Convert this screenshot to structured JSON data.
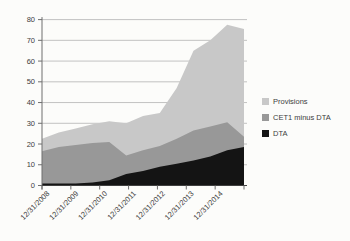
{
  "chart_data": {
    "type": "area",
    "stacked": true,
    "title": "",
    "xlabel": "",
    "ylabel": "",
    "ylim": [
      0,
      80
    ],
    "ytick_interval": 10,
    "ytick_labels": [
      "0",
      "10",
      "20",
      "30",
      "40",
      "50",
      "60",
      "70",
      "80"
    ],
    "xtick_labels": [
      "12/31/2008",
      "12/31/2009",
      "12/31/2010",
      "12/31/2011",
      "12/31/2012",
      "12/31/2013",
      "12/31/2014"
    ],
    "points_per_label_interval": 2,
    "grid": true,
    "legend_position": "right",
    "legend": [
      {
        "label": "Provisions",
        "color": "#c8c8c8"
      },
      {
        "label": "CET1 minus DTA",
        "color": "#989898"
      },
      {
        "label": "DTA",
        "color": "#141414"
      }
    ],
    "series": [
      {
        "name": "DTA",
        "color": "#141414",
        "values": [
          1,
          1,
          1,
          1.5,
          2.5,
          5.5,
          7,
          9,
          10.5,
          12,
          14,
          17,
          18.5
        ]
      },
      {
        "name": "CET1 minus DTA",
        "color": "#989898",
        "values": [
          15.5,
          17.5,
          18.5,
          19,
          18.5,
          9,
          10,
          10,
          12,
          14.5,
          14.5,
          13.5,
          5
        ]
      },
      {
        "name": "Provisions",
        "color": "#c8c8c8",
        "values": [
          6,
          7,
          8,
          9,
          10,
          15.5,
          16.5,
          16,
          24.5,
          38.5,
          41.5,
          47,
          52
        ]
      }
    ],
    "colors": {
      "axis": "#6e6e6e",
      "x_axis_line": "#3f3f3f",
      "gridline": "#b3b3b3",
      "tick_text": "#3c3c3c"
    }
  }
}
